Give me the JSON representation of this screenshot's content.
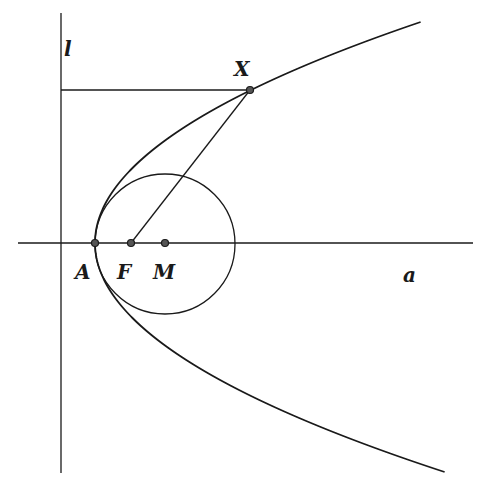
{
  "diagram": {
    "colors": {
      "stroke": "#1a1a1a",
      "point_fill": "#555555",
      "background": "#ffffff"
    },
    "labels": {
      "directrix": "l",
      "axis": "a",
      "point_x": "X",
      "vertex": "A",
      "focus": "F",
      "center": "M"
    },
    "geometry": {
      "axis_line": {
        "x1": 18,
        "y1": 243,
        "x2": 473,
        "y2": 243
      },
      "directrix_line": {
        "x1": 61,
        "y1": 13,
        "x2": 61,
        "y2": 473
      },
      "perpendicular": {
        "x1": 61,
        "y1": 90,
        "x2": 250,
        "y2": 90
      },
      "parabola": {
        "vertex_x": 95,
        "vertex_y": 243,
        "p": 37.5,
        "y_top": 22,
        "y_bottom": 473
      },
      "circle": {
        "cx": 165,
        "cy": 244,
        "r": 70
      },
      "points": {
        "A": {
          "x": 95,
          "y": 243
        },
        "F": {
          "x": 131,
          "y": 243
        },
        "M": {
          "x": 165,
          "y": 243
        },
        "X": {
          "x": 250,
          "y": 90
        }
      },
      "segment_FX": {
        "x1": 131,
        "y1": 243,
        "x2": 250,
        "y2": 90
      }
    }
  }
}
